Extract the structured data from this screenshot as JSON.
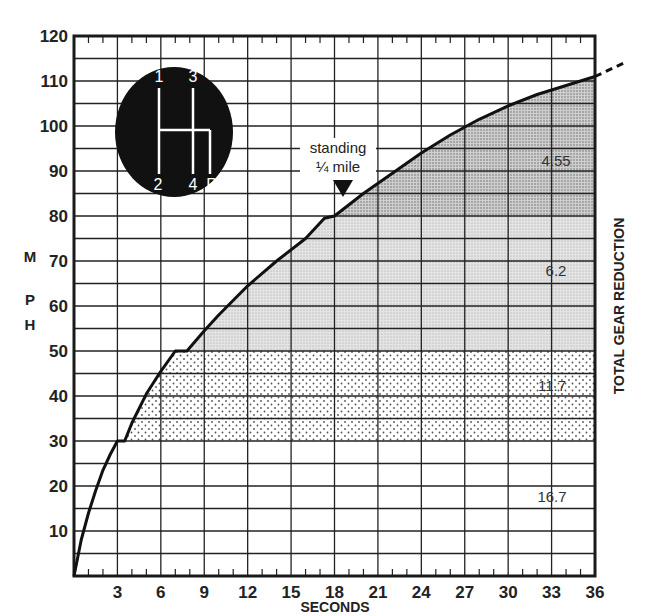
{
  "chart_data": {
    "type": "line",
    "title": "",
    "xlabel": "SECONDS",
    "ylabel": "MPH",
    "right_label": "TOTAL GEAR REDUCTION",
    "xlim": [
      0,
      36
    ],
    "ylim": [
      0,
      120
    ],
    "x_ticks": [
      3,
      6,
      9,
      12,
      15,
      18,
      21,
      24,
      27,
      30,
      33,
      36
    ],
    "y_ticks": [
      10,
      20,
      30,
      40,
      50,
      60,
      70,
      80,
      90,
      100,
      110,
      120
    ],
    "grid": true,
    "series": [
      {
        "name": "Acceleration (MPH vs seconds)",
        "x": [
          0,
          0.5,
          1,
          1.5,
          2,
          2.5,
          3,
          3.5,
          4,
          5,
          6,
          7,
          7.8,
          9,
          10,
          12,
          14,
          16,
          17.3,
          18,
          20,
          22,
          24,
          26,
          28,
          30,
          32,
          34,
          36
        ],
        "y": [
          0,
          8,
          14,
          19,
          23.5,
          27,
          30,
          30,
          34,
          40.5,
          45.5,
          50,
          50,
          54.5,
          58,
          64.5,
          70,
          75,
          79.5,
          80,
          85,
          89.5,
          94,
          98,
          101.5,
          104.5,
          107,
          109,
          111
        ]
      }
    ],
    "gear_bands": [
      {
        "gear_reduction": "16.7",
        "mph_from": 0,
        "mph_to": 30,
        "fill": "none"
      },
      {
        "gear_reduction": "11.7",
        "mph_from": 30,
        "mph_to": 50,
        "fill": "dots"
      },
      {
        "gear_reduction": "6.2",
        "mph_from": 50,
        "mph_to": 80,
        "fill": "light-gray"
      },
      {
        "gear_reduction": "4.55",
        "mph_from": 80,
        "mph_to": 111,
        "fill": "dark-gray"
      }
    ],
    "annotations": [
      {
        "text": "standing",
        "text2": "¼ mile",
        "x": 18,
        "y": 80,
        "marker": "down-triangle"
      }
    ],
    "extrapolation": {
      "style": "dashed",
      "from": [
        36,
        111
      ],
      "to": [
        38,
        114
      ]
    },
    "inset": {
      "type": "shift-pattern",
      "positions": [
        "1",
        "2",
        "3",
        "4",
        "R"
      ]
    }
  },
  "labels": {
    "ylabel_letters": [
      "M",
      "P",
      "H"
    ],
    "annotation_line1": "standing",
    "annotation_line2": "¼ mile",
    "shift": {
      "p1": "1",
      "p2": "2",
      "p3": "3",
      "p4": "4",
      "pR": "R"
    }
  }
}
